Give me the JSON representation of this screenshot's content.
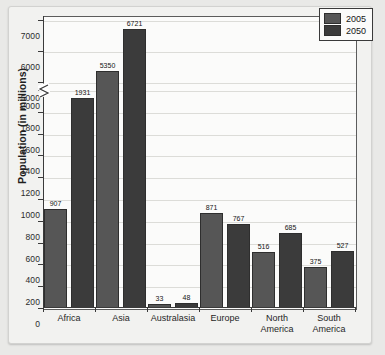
{
  "chart_data": {
    "type": "bar",
    "title": "",
    "xlabel": "",
    "ylabel": "Population (in millions)",
    "categories": [
      "Africa",
      "Asia",
      "Australasia",
      "Europe",
      "North\nAmerica",
      "South\nAmerica"
    ],
    "series": [
      {
        "name": "2005",
        "color": "#565656",
        "values": [
          907,
          5350,
          33,
          871,
          516,
          375
        ]
      },
      {
        "name": "2050",
        "color": "#3b3b3b",
        "values": [
          1931,
          6721,
          48,
          767,
          685,
          527
        ]
      }
    ],
    "yticks": [
      0,
      200,
      400,
      600,
      800,
      1000,
      1200,
      1400,
      1600,
      1800,
      2000,
      5000,
      6000,
      7000
    ],
    "ylim": [
      0,
      7000
    ],
    "axis_break": {
      "present": true,
      "between": [
        2000,
        5000
      ]
    },
    "grid": true,
    "legend_position": "top-right",
    "data_labels": true
  },
  "legend": {
    "entries": [
      {
        "label": "2005"
      },
      {
        "label": "2050"
      }
    ]
  },
  "colors": {
    "series_2005": "#565656",
    "series_2050": "#3b3b3b",
    "axis": "#3a3a3a",
    "grid": "#dcdcd8",
    "plot_background": "#fbfbfa"
  }
}
